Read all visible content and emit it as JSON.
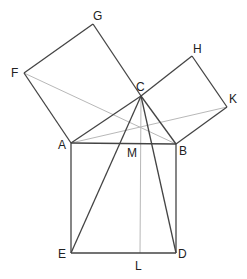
{
  "colors": {
    "dark": "#444444",
    "light": "#b8b8b8",
    "label": "#222222"
  },
  "points": {
    "A": {
      "x": 71,
      "y": 143,
      "label": "A",
      "lx": 58,
      "ly": 149
    },
    "B": {
      "x": 176,
      "y": 144,
      "label": "B",
      "lx": 179,
      "ly": 155
    },
    "C": {
      "x": 141,
      "y": 96,
      "label": "C",
      "lx": 136,
      "ly": 91
    },
    "D": {
      "x": 176,
      "y": 253,
      "label": "D",
      "lx": 178,
      "ly": 258
    },
    "E": {
      "x": 71,
      "y": 253,
      "label": "E",
      "lx": 58,
      "ly": 258
    },
    "F": {
      "x": 24,
      "y": 73,
      "label": "F",
      "lx": 11,
      "ly": 77
    },
    "G": {
      "x": 93,
      "y": 24,
      "label": "G",
      "lx": 93,
      "ly": 20
    },
    "H": {
      "x": 192,
      "y": 56,
      "label": "H",
      "lx": 193,
      "ly": 53
    },
    "K": {
      "x": 227,
      "y": 107,
      "label": "K",
      "lx": 229,
      "ly": 103
    },
    "L": {
      "x": 140,
      "y": 253,
      "label": "L",
      "lx": 135,
      "ly": 270
    },
    "M": {
      "x": 140,
      "y": 143,
      "label": "M",
      "lx": 127,
      "ly": 157
    }
  },
  "segments_dark": [
    [
      "A",
      "B"
    ],
    [
      "B",
      "D"
    ],
    [
      "D",
      "E"
    ],
    [
      "E",
      "A"
    ],
    [
      "A",
      "F"
    ],
    [
      "F",
      "G"
    ],
    [
      "G",
      "C"
    ],
    [
      "C",
      "A"
    ],
    [
      "C",
      "H"
    ],
    [
      "H",
      "K"
    ],
    [
      "K",
      "B"
    ],
    [
      "B",
      "C"
    ],
    [
      "C",
      "E"
    ],
    [
      "C",
      "D"
    ]
  ],
  "segments_light": [
    [
      "F",
      "B"
    ],
    [
      "A",
      "K"
    ],
    [
      "C",
      "L"
    ]
  ]
}
